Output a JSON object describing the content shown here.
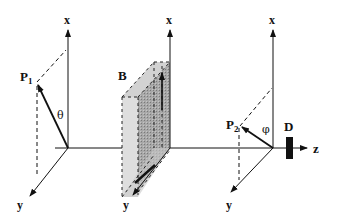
{
  "diagram": {
    "type": "experimental-setup-schematic",
    "axes_groups": [
      {
        "name": "frame-1",
        "x_label": "x",
        "y_label": "y",
        "point_label": "P",
        "point_subscript": "1",
        "angle_label": "θ"
      },
      {
        "name": "frame-2",
        "x_label": "x",
        "y_label": "y",
        "object_label": "B"
      },
      {
        "name": "frame-3",
        "x_label": "x",
        "y_label": "y",
        "point_label": "P",
        "point_subscript": "2",
        "angle_label": "φ",
        "detector_label": "D"
      }
    ],
    "z_axis_label": "z",
    "colors": {
      "line": "#111111",
      "box_front": "#d9d9d9",
      "box_side": "#9a9a9a",
      "box_top": "#cfcfcf",
      "detector": "#111111"
    }
  }
}
